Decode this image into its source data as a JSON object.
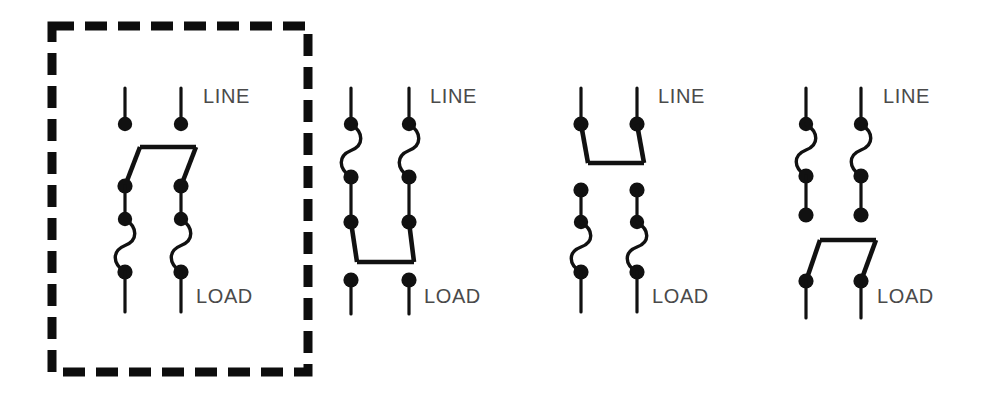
{
  "figure": {
    "kind": "electrical-schematic",
    "background_color": "#ffffff",
    "ink_color": "#111111",
    "label_color": "#4a4a4a",
    "width": 987,
    "height": 397
  },
  "selection": {
    "name": "variant-1-selection",
    "applies_to_variant": 1,
    "style": "dashed-rectangle",
    "color": "#0d0d0d",
    "x": 52,
    "y": 26,
    "width": 256,
    "height": 346,
    "stroke_width": 9,
    "dash": "22 11"
  },
  "labels": {
    "line": "LINE",
    "load": "LOAD"
  },
  "variants": [
    {
      "id": 1,
      "name": "switch-above-fuses",
      "selected": true,
      "order": [
        "switch",
        "fuse"
      ],
      "switch_tie_bar": "top",
      "poles": 2,
      "label_line": "LINE",
      "label_load": "LOAD",
      "line_x": [
        125,
        181
      ],
      "label_line_xy": [
        203,
        103
      ],
      "label_load_xy": [
        196,
        303
      ],
      "line_top_y": 88,
      "line_terminal_y": 124,
      "pivot_y": 186,
      "tie_bar_y": 147,
      "tie_bar_x": [
        140,
        196
      ],
      "fuse_top_y": 219,
      "fuse_bottom_y": 272,
      "load_line_bottom_y": 312
    },
    {
      "id": 2,
      "name": "fuses-above-switch",
      "selected": false,
      "order": [
        "fuse",
        "switch"
      ],
      "switch_tie_bar": "bottom",
      "poles": 2,
      "label_line": "LINE",
      "label_load": "LOAD",
      "line_x": [
        351,
        409
      ],
      "label_line_xy": [
        430,
        103
      ],
      "label_load_xy": [
        424,
        303
      ],
      "line_top_y": 88,
      "line_terminal_y": 124,
      "fuse_top_y": 124,
      "fuse_bottom_y": 177,
      "pivot_y": 222,
      "tie_bar_y": 262,
      "tie_bar_x": [
        357,
        414
      ],
      "load_terminal_y": 280,
      "load_line_bottom_y": 314
    },
    {
      "id": 3,
      "name": "switch-top-fuses-bottom",
      "selected": false,
      "order": [
        "switch",
        "fuse"
      ],
      "switch_tie_bar": "bottom",
      "poles": 2,
      "label_line": "LINE",
      "label_load": "LOAD",
      "line_x": [
        581,
        637
      ],
      "label_line_xy": [
        658,
        103
      ],
      "label_load_xy": [
        652,
        303
      ],
      "line_top_y": 88,
      "line_terminal_y": 124,
      "pivot_y": 124,
      "tie_bar_y": 163,
      "tie_bar_x": [
        588,
        644
      ],
      "fuse_terminal_top_y": 190,
      "fuse_top_y": 222,
      "fuse_bottom_y": 272,
      "load_line_bottom_y": 312
    },
    {
      "id": 4,
      "name": "fuses-top-switch-bottom",
      "selected": false,
      "order": [
        "fuse",
        "switch"
      ],
      "switch_tie_bar": "top",
      "poles": 2,
      "label_line": "LINE",
      "label_load": "LOAD",
      "line_x": [
        806,
        861
      ],
      "label_line_xy": [
        883,
        103
      ],
      "label_load_xy": [
        877,
        303
      ],
      "line_top_y": 88,
      "line_terminal_y": 124,
      "fuse_top_y": 124,
      "fuse_bottom_y": 176,
      "fuse_terminal_bottom_y": 215,
      "pivot_y": 281,
      "tie_bar_y": 240,
      "tie_bar_x": [
        820,
        876
      ],
      "load_line_bottom_y": 318
    }
  ],
  "symbol_legend": {
    "dot": "terminal-dot",
    "squiggle": "fuse-symbol",
    "diagonal_bar": "switch-blade",
    "horizontal_bar": "ganged-tie-bar"
  }
}
